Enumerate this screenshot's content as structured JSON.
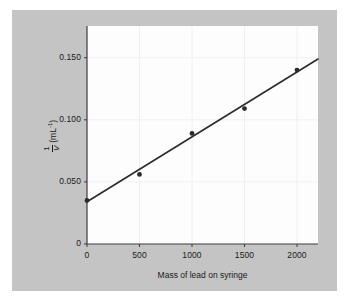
{
  "chart_data": {
    "type": "scatter",
    "title": "",
    "xlabel": "Mass of lead on syringe",
    "ylabel_numerator": "1",
    "ylabel_denominator": "V",
    "ylabel_unit": "(mL",
    "ylabel_unit_exp": "-1",
    "ylabel_unit_close": ")",
    "ylabel_full": "1/V (mL^-1)",
    "x": [
      0,
      500,
      1000,
      1500,
      2000
    ],
    "values": [
      0.035,
      0.056,
      0.089,
      0.109,
      0.14
    ],
    "series": [
      {
        "name": "measured",
        "points": [
          {
            "x": 0,
            "y": 0.035
          },
          {
            "x": 500,
            "y": 0.056
          },
          {
            "x": 1000,
            "y": 0.089
          },
          {
            "x": 1500,
            "y": 0.109
          },
          {
            "x": 2000,
            "y": 0.14
          }
        ]
      }
    ],
    "trendline": {
      "type": "linear",
      "intercept": 0.034,
      "slope": 5.22e-05,
      "x_start": 0,
      "x_end": 2200,
      "y_start": 0.034,
      "y_end": 0.1489
    },
    "xlim": [
      0,
      2200
    ],
    "ylim": [
      0,
      0.1755
    ],
    "xticks": [
      0,
      500,
      1000,
      1500,
      2000
    ],
    "xtick_labels": [
      "0",
      "500",
      "1000",
      "1500",
      "2000"
    ],
    "yticks": [
      0,
      0.05,
      0.1,
      0.15
    ],
    "ytick_labels": [
      "0",
      "0.050",
      "0.100",
      "0.150"
    ],
    "grid": true,
    "legend": "none",
    "colors": {
      "panel": "#c4c4c4",
      "plot_background": "#fdfdfd",
      "axis": "#3d3d3d",
      "line": "#2b2b2b",
      "marker": "#2b2b2b",
      "grid": "#f0f0f0",
      "text": "#1a1a1a"
    }
  }
}
